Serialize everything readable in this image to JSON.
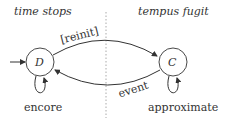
{
  "regions": {
    "left": {
      "title": "time stops"
    },
    "right": {
      "title": "tempus fugit"
    }
  },
  "states": [
    {
      "id": "D",
      "label": "D",
      "self_loop_label": "encore",
      "initial": true
    },
    {
      "id": "C",
      "label": "C",
      "self_loop_label": "approximate",
      "initial": false
    }
  ],
  "transitions": [
    {
      "from": "D",
      "to": "C",
      "label": "[reinit]"
    },
    {
      "from": "C",
      "to": "D",
      "label": "event"
    }
  ],
  "colors": {
    "stroke": "#333333",
    "divider": "#aaaaaa",
    "text": "#333333"
  }
}
